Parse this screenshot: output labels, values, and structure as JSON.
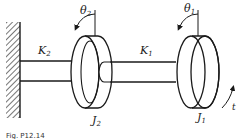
{
  "diagram": {
    "type": "torsional two-disk shaft system",
    "labels": {
      "theta2": "θ",
      "theta2_sub": "2",
      "theta1": "θ",
      "theta1_sub": "1",
      "k2": "K",
      "k2_sub": "2",
      "k1": "K",
      "k1_sub": "1",
      "j2": "J",
      "j2_sub": "2",
      "j1": "J",
      "j1_sub": "1",
      "t": "t"
    },
    "caption": "Fig. P12.14",
    "colors": {
      "stroke": "#1a1a1a",
      "background": "#ffffff"
    }
  }
}
